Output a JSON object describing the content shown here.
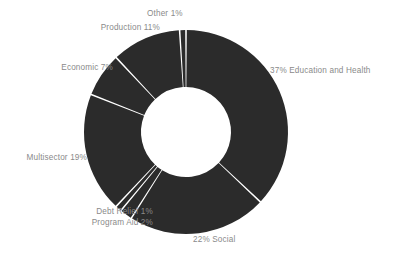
{
  "chart_data": {
    "type": "pie",
    "variant": "donut",
    "title": "",
    "subtitle": "",
    "xlabel": "",
    "ylabel": "",
    "legend_position": "none",
    "grid": false,
    "units": "percent",
    "total": 100,
    "start_angle_deg": 0,
    "direction": "clockwise",
    "categories": [
      "Education and Health",
      "Social",
      "Program Aid",
      "Debt Relief",
      "Multisector",
      "Economic",
      "Production",
      "Other"
    ],
    "values": [
      37,
      22,
      2,
      1,
      19,
      7,
      11,
      1
    ],
    "slice_color": "#2b2b2b",
    "separator_color": "#ffffff",
    "label_color": "#8a8a8a",
    "background_color": "#ffffff",
    "slices": [
      {
        "name": "Education and Health",
        "value": 37,
        "label": "37% Education and Health"
      },
      {
        "name": "Social",
        "value": 22,
        "label": "22% Social"
      },
      {
        "name": "Program Aid",
        "value": 2,
        "label": "Program Aid 2%"
      },
      {
        "name": "Debt Relief",
        "value": 1,
        "label": "Debt Relief 1%"
      },
      {
        "name": "Multisector",
        "value": 19,
        "label": "Multisector 19%"
      },
      {
        "name": "Economic",
        "value": 7,
        "label": "Economic 7%"
      },
      {
        "name": "Production",
        "value": 11,
        "label": "Production 11%"
      },
      {
        "name": "Other",
        "value": 1,
        "label": "Other 1%"
      }
    ]
  },
  "labels": {
    "education_health": "37% Education and Health",
    "social": "22% Social",
    "program_aid": "Program Aid 2%",
    "debt_relief": "Debt Relief 1%",
    "multisector": "Multisector 19%",
    "economic": "Economic 7%",
    "production": "Production 11%",
    "other": "Other 1%"
  }
}
